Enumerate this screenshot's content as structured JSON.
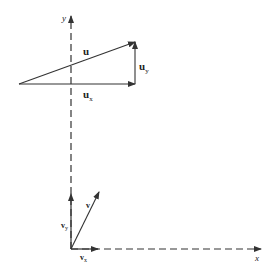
{
  "diagram": {
    "title": "",
    "axes": {
      "x_label": "x",
      "y_label": "y"
    },
    "vector_u": {
      "label": "u",
      "x_component": {
        "base": "u",
        "sub": "x"
      },
      "y_component": {
        "base": "u",
        "sub": "y"
      }
    },
    "vector_v": {
      "label": "v",
      "x_component": {
        "base": "v",
        "sub": "x"
      },
      "y_component": {
        "base": "v",
        "sub": "y"
      }
    },
    "colors": {
      "line": "#333333",
      "background": "#ffffff"
    }
  }
}
